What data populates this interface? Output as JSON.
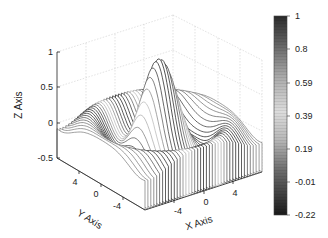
{
  "chart_data": {
    "type": "surface",
    "subtype": "waterfall",
    "title": "",
    "function": "z = sin(r)/r, r = sqrt(x^2 + y^2)",
    "xlabel": "X Axis",
    "ylabel": "Y Axis",
    "zlabel": "Z Axis",
    "xlim": [
      -8,
      8
    ],
    "ylim": [
      -8,
      8
    ],
    "zlim": [
      -0.5,
      1
    ],
    "xticks": [
      "-4",
      "0",
      "4"
    ],
    "yticks": [
      "4",
      "0",
      "-4"
    ],
    "zticks": [
      "1",
      "0.5",
      "0",
      "-0.5"
    ],
    "grid": true,
    "colorbar": {
      "ticks": [
        "1",
        "0.8",
        "0.59",
        "0.39",
        "0.19",
        "-0.01",
        "-0.22"
      ],
      "range": [
        -0.22,
        1
      ],
      "colormap": "gray-lines (dark at extremes, light in middle)"
    },
    "peak": {
      "x": 0,
      "y": 0,
      "z": 1
    }
  },
  "axes": {
    "zlabel": "Z Axis",
    "ylabel": "Y Axis",
    "xlabel": "X Axis",
    "zticks": [
      "1",
      "0.5",
      "0",
      "-0.5"
    ],
    "yticks": [
      "4",
      "0",
      "-4"
    ],
    "xticks": [
      "-4",
      "0",
      "4"
    ]
  },
  "colorbar": {
    "ticks": [
      "1",
      "0.8",
      "0.59",
      "0.39",
      "0.19",
      "-0.01",
      "-0.22"
    ]
  }
}
